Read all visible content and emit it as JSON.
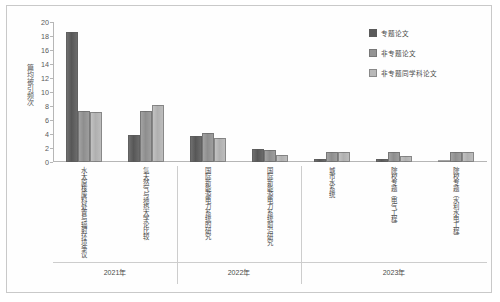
{
  "chart_data": {
    "type": "bar",
    "title": "",
    "xlabel": "",
    "ylabel": "篇均被引频次",
    "ylim": [
      0,
      20
    ],
    "yticks": [
      0,
      2,
      4,
      6,
      8,
      10,
      12,
      14,
      16,
      18,
      20
    ],
    "grid": false,
    "legend_position": "top-right",
    "categories": [
      "水太原核废料处置与辐射环境争议",
      "氢天然气与地热大学论比较",
      "国际新能源电力系统的研究",
      "国际新能源电力系统前沿研究",
      "城市水系统",
      "院校专题（电气工程）",
      "院校专题（水利水电工程）"
    ],
    "group_bands": [
      {
        "label": "2021年",
        "categories": [
          0,
          1
        ]
      },
      {
        "label": "2022年",
        "categories": [
          2,
          3
        ]
      },
      {
        "label": "2023年",
        "categories": [
          4,
          5,
          6
        ]
      }
    ],
    "series": [
      {
        "name": "专题论文",
        "color": "#5a5a5a",
        "values": [
          18.6,
          3.8,
          3.7,
          1.8,
          0.4,
          0.4,
          0.3
        ]
      },
      {
        "name": "非专题论文",
        "color": "#949494",
        "values": [
          7.3,
          7.3,
          4.2,
          1.7,
          1.4,
          1.5,
          1.5
        ]
      },
      {
        "name": "非专题同学科论文",
        "color": "#b8b8b8",
        "values": [
          7.1,
          8.2,
          3.4,
          1.0,
          1.4,
          0.8,
          1.4
        ]
      }
    ]
  },
  "legend": {
    "entries": [
      {
        "label": "专题论文"
      },
      {
        "label": "非专题论文"
      },
      {
        "label": "非专题同学科论文"
      }
    ]
  }
}
